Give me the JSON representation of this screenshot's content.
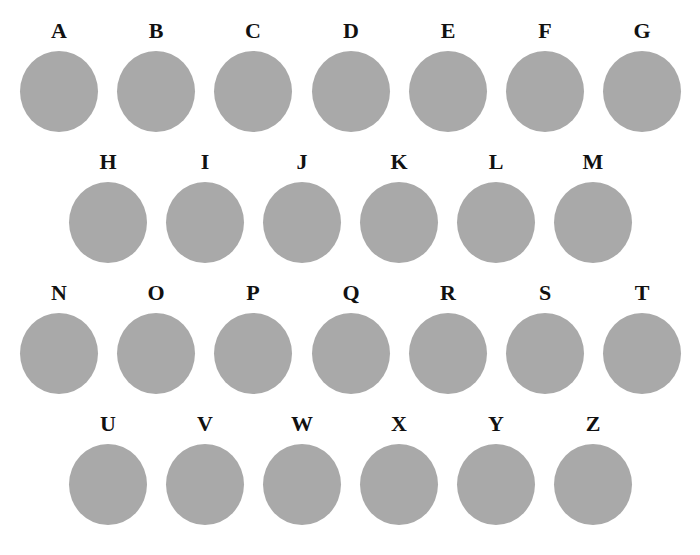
{
  "figure": {
    "circle_color": "#a9a9a9",
    "label_color": "#111111",
    "rows": [
      {
        "items": [
          {
            "label": "A"
          },
          {
            "label": "B"
          },
          {
            "label": "C"
          },
          {
            "label": "D"
          },
          {
            "label": "E"
          },
          {
            "label": "F"
          },
          {
            "label": "G"
          }
        ]
      },
      {
        "items": [
          {
            "label": "H"
          },
          {
            "label": "I"
          },
          {
            "label": "J"
          },
          {
            "label": "K"
          },
          {
            "label": "L"
          },
          {
            "label": "M"
          }
        ]
      },
      {
        "items": [
          {
            "label": "N"
          },
          {
            "label": "O"
          },
          {
            "label": "P"
          },
          {
            "label": "Q"
          },
          {
            "label": "R"
          },
          {
            "label": "S"
          },
          {
            "label": "T"
          }
        ]
      },
      {
        "items": [
          {
            "label": "U"
          },
          {
            "label": "V"
          },
          {
            "label": "W"
          },
          {
            "label": "X"
          },
          {
            "label": "Y"
          },
          {
            "label": "Z"
          }
        ]
      }
    ]
  }
}
